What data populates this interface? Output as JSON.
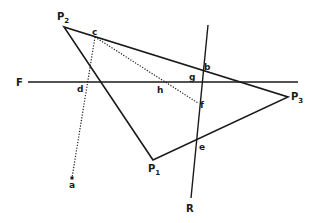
{
  "diagram": {
    "type": "geometric construction",
    "colors": {
      "line": "#1a1a1a",
      "background": "#ffffff"
    },
    "points": {
      "P1": {
        "label": "P",
        "subscript": "1",
        "x": 153,
        "y": 160,
        "lx": 148,
        "ly": 172
      },
      "P2": {
        "label": "P",
        "subscript": "2",
        "x": 64,
        "y": 27,
        "lx": 57,
        "ly": 20
      },
      "P3": {
        "label": "P",
        "subscript": "3",
        "x": 288,
        "y": 97,
        "lx": 291,
        "ly": 100
      },
      "a": {
        "label": "a",
        "x": 72,
        "y": 178,
        "lx": 69,
        "ly": 188
      },
      "b": {
        "label": "b",
        "x": 201,
        "y": 70,
        "lx": 204,
        "ly": 70
      },
      "c": {
        "label": "c",
        "x": 95,
        "y": 37,
        "lx": 92,
        "ly": 35
      },
      "d": {
        "label": "d",
        "x": 87,
        "y": 82,
        "lx": 77,
        "ly": 92
      },
      "e": {
        "label": "e",
        "x": 196,
        "y": 142,
        "lx": 199,
        "ly": 150
      },
      "f": {
        "label": "f",
        "x": 198,
        "y": 103,
        "lx": 200,
        "ly": 108
      },
      "g": {
        "label": "g",
        "x": 199,
        "y": 82,
        "lx": 189,
        "ly": 80
      },
      "h": {
        "label": "h",
        "x": 163,
        "y": 82,
        "lx": 157,
        "ly": 93
      }
    },
    "lines": {
      "F": {
        "label": "F",
        "x1": 28,
        "y1": 82,
        "x2": 298,
        "y2": 82,
        "lx": 16,
        "ly": 86
      },
      "R": {
        "label": "R",
        "x1": 208,
        "y1": 25,
        "x2": 191,
        "y2": 198,
        "lx": 186,
        "ly": 212
      }
    },
    "triangle": [
      "P1",
      "P2",
      "P3"
    ],
    "dotted_segments": [
      [
        "c",
        "a"
      ],
      [
        "c",
        "f"
      ]
    ]
  }
}
